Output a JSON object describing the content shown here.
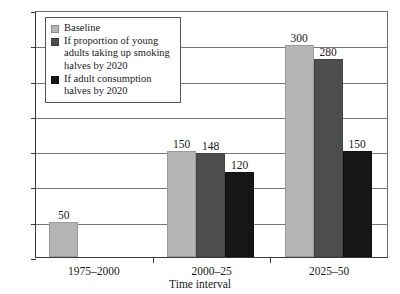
{
  "chart_data": {
    "type": "bar",
    "title": "",
    "subtitle": "",
    "xlabel": "Time interval",
    "ylabel": "",
    "categories": [
      "1975–2000",
      "2000–25",
      "2025–50"
    ],
    "series": [
      {
        "name": "Baseline",
        "key": "baseline",
        "color": "#b5b5b5",
        "values": [
          50,
          150,
          300
        ]
      },
      {
        "name": "If proportion of young adults taking up smoking halves by 2020",
        "key": "young-adults-halve",
        "color": "#4d4d4d",
        "values": [
          null,
          148,
          280
        ]
      },
      {
        "name": "If adult consumption halves by 2020",
        "key": "adult-consumption-halve",
        "color": "#161616",
        "values": [
          null,
          120,
          150
        ]
      }
    ],
    "data_labels": [
      [
        "50",
        null,
        null
      ],
      [
        "150",
        "148",
        "120"
      ],
      [
        "300",
        "280",
        "150"
      ]
    ],
    "ylim": [
      0,
      350
    ],
    "yticks": [
      0,
      50,
      100,
      150,
      200,
      250,
      300,
      350
    ],
    "ytick_labels": [
      "0",
      "50",
      "100",
      "150",
      "200",
      "250",
      "300",
      "350"
    ],
    "grid": true,
    "legend_position": "top-left"
  },
  "legend": {
    "items": [
      {
        "label": "Baseline",
        "swatch": "legend-swatch-baseline"
      },
      {
        "label": "If proportion of young adults taking up smoking halves by 2020",
        "swatch": "legend-swatch-young-adults"
      },
      {
        "label": "If adult consumption halves by 2020",
        "swatch": "legend-swatch-adult-consumption"
      }
    ]
  },
  "axes": {
    "x_title": "Time interval"
  }
}
